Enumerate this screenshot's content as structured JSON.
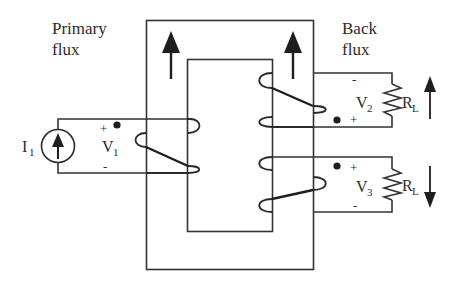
{
  "diagram": {
    "type": "transformer-core-circuit",
    "labels": {
      "primary_flux_line1": "Primary",
      "primary_flux_line2": "flux",
      "back_flux_line1": "Back",
      "back_flux_line2": "flux"
    },
    "primary": {
      "source_label": "I",
      "source_subscript": "1",
      "voltage_label": "V",
      "voltage_subscript": "1",
      "plus": "+",
      "minus": "-"
    },
    "secondary_top": {
      "voltage_label": "V",
      "voltage_subscript": "2",
      "plus": "+",
      "minus": "-",
      "load_label": "R",
      "load_subscript": "L",
      "current_direction": "up"
    },
    "secondary_bottom": {
      "voltage_label": "V",
      "voltage_subscript": "3",
      "plus": "+",
      "minus": "-",
      "load_label": "R",
      "load_subscript": "L",
      "current_direction": "down"
    },
    "core_flux_arrows": [
      "up",
      "up"
    ],
    "colors": {
      "ink": "#2b2b2b",
      "background": "#ffffff"
    }
  }
}
